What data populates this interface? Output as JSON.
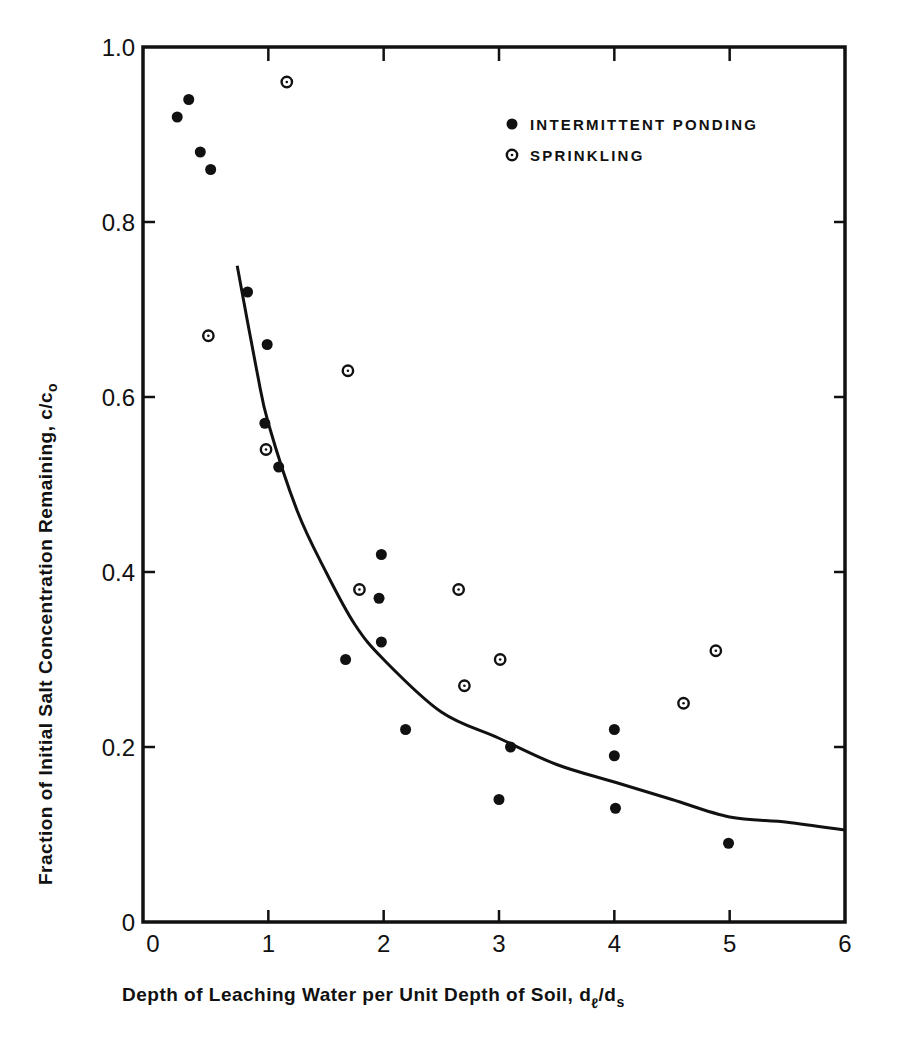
{
  "chart_data": {
    "type": "scatter",
    "title": "",
    "xlabel": "Depth of Leaching Water per Unit Depth of Soil, dₗ/dₛ",
    "xlabel_main": "Depth of Leaching Water per Unit Depth of Soil, d",
    "xlabel_sub1": "ℓ",
    "xlabel_slash": "/d",
    "xlabel_sub2": "s",
    "ylabel": "Fraction of Initial Salt Concentration Remaining, c/c₀",
    "ylabel_main": "Fraction of Initial Salt Concentration Remaining, c/c",
    "ylabel_sub": "o",
    "xlim": [
      0,
      6
    ],
    "ylim": [
      0,
      1.0
    ],
    "xticks": [
      0,
      1,
      2,
      3,
      4,
      5,
      6
    ],
    "xtick_labels": [
      "0",
      "1",
      "2",
      "3",
      "4",
      "5",
      "6"
    ],
    "yticks": [
      0,
      0.2,
      0.4,
      0.6,
      0.8,
      1.0
    ],
    "ytick_labels": [
      "0",
      "0.2",
      "0.4",
      "0.6",
      "0.8",
      "1.0"
    ],
    "grid": false,
    "legend_position": "upper right",
    "series": [
      {
        "name": "INTERMITTENT PONDING",
        "marker": "filled-circle",
        "points": [
          {
            "x": 0.21,
            "y": 0.92
          },
          {
            "x": 0.31,
            "y": 0.94
          },
          {
            "x": 0.41,
            "y": 0.88
          },
          {
            "x": 0.5,
            "y": 0.86
          },
          {
            "x": 0.82,
            "y": 0.72
          },
          {
            "x": 0.99,
            "y": 0.66
          },
          {
            "x": 0.97,
            "y": 0.57
          },
          {
            "x": 1.09,
            "y": 0.52
          },
          {
            "x": 1.98,
            "y": 0.42
          },
          {
            "x": 1.96,
            "y": 0.37
          },
          {
            "x": 1.98,
            "y": 0.32
          },
          {
            "x": 1.67,
            "y": 0.3
          },
          {
            "x": 2.19,
            "y": 0.22
          },
          {
            "x": 3.1,
            "y": 0.2
          },
          {
            "x": 3.0,
            "y": 0.14
          },
          {
            "x": 4.0,
            "y": 0.22
          },
          {
            "x": 4.0,
            "y": 0.19
          },
          {
            "x": 4.01,
            "y": 0.13
          },
          {
            "x": 4.99,
            "y": 0.09
          }
        ]
      },
      {
        "name": "SPRINKLING",
        "marker": "dotted-circle",
        "points": [
          {
            "x": 1.16,
            "y": 0.96
          },
          {
            "x": 0.48,
            "y": 0.67
          },
          {
            "x": 0.98,
            "y": 0.54
          },
          {
            "x": 1.69,
            "y": 0.63
          },
          {
            "x": 1.79,
            "y": 0.38
          },
          {
            "x": 2.65,
            "y": 0.38
          },
          {
            "x": 3.01,
            "y": 0.3
          },
          {
            "x": 2.7,
            "y": 0.27
          },
          {
            "x": 4.6,
            "y": 0.25
          },
          {
            "x": 4.88,
            "y": 0.31
          }
        ]
      },
      {
        "name": "fitted curve",
        "marker": "line",
        "points": [
          {
            "x": 0.73,
            "y": 0.75
          },
          {
            "x": 0.9,
            "y": 0.63
          },
          {
            "x": 1.0,
            "y": 0.57
          },
          {
            "x": 1.25,
            "y": 0.47
          },
          {
            "x": 1.5,
            "y": 0.4
          },
          {
            "x": 1.75,
            "y": 0.34
          },
          {
            "x": 2.0,
            "y": 0.3
          },
          {
            "x": 2.5,
            "y": 0.24
          },
          {
            "x": 3.0,
            "y": 0.21
          },
          {
            "x": 3.5,
            "y": 0.18
          },
          {
            "x": 4.0,
            "y": 0.16
          },
          {
            "x": 4.5,
            "y": 0.14
          },
          {
            "x": 5.0,
            "y": 0.12
          },
          {
            "x": 5.5,
            "y": 0.114
          },
          {
            "x": 6.0,
            "y": 0.105
          }
        ]
      }
    ]
  },
  "legend": {
    "items": [
      {
        "label": "INTERMITTENT PONDING",
        "marker": "filled-circle"
      },
      {
        "label": "SPRINKLING",
        "marker": "dotted-circle"
      }
    ]
  }
}
